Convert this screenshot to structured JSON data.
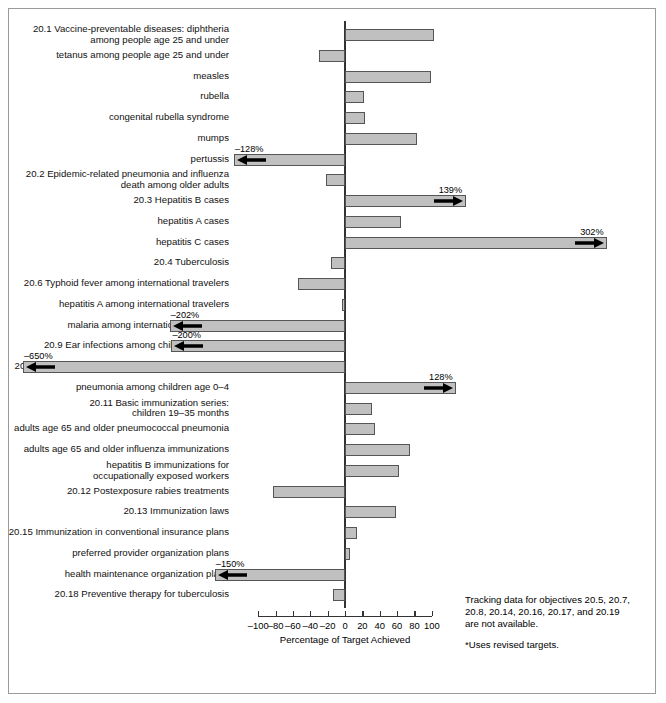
{
  "figure": {
    "xlabel": "Percentage of Target Achieved",
    "notes_line1": "Tracking data for objectives 20.5, 20.7,",
    "notes_line2": "20.8, 20.14, 20.16, 20.17, and 20.19",
    "notes_line3": "are not available.",
    "notes_line4": "*Uses revised targets.",
    "bar_fill": "#c0c0c0",
    "bar_stroke": "#555555",
    "axis_color": "#333333"
  },
  "chart_data": {
    "type": "bar",
    "orientation": "horizontal",
    "title": "",
    "xlabel": "Percentage of Target Achieved",
    "ylabel": "",
    "xlim": [
      -100,
      100
    ],
    "xticks": [
      -100,
      -80,
      -60,
      -40,
      -20,
      0,
      20,
      40,
      60,
      80,
      100
    ],
    "xticklabels": [
      "–100",
      "–80",
      "–60",
      "–40",
      "–20",
      "0",
      "20",
      "40",
      "60",
      "80",
      "100"
    ],
    "grid": false,
    "legend": "none",
    "annotations": [
      "Tracking data for objectives 20.5, 20.7, 20.8, 20.14, 20.16, 20.17, and 20.19 are not available.",
      "*Uses revised targets."
    ],
    "categories": [
      "20.1 Vaccine-preventable diseases: diphtheria\namong people age 25 and under",
      "tetanus among people age 25 and under",
      "measles",
      "rubella",
      "congenital rubella syndrome",
      "mumps",
      "pertussis",
      "20.2 Epidemic-related pneumonia and influenza\ndeath among older adults",
      "20.3 Hepatitis B cases",
      "hepatitis A cases",
      "hepatitis C cases",
      "20.4 Tuberculosis",
      "20.6 Typhoid fever among international travelers",
      "hepatitis A among international travelers",
      "malaria among international travelers*",
      "20.9 Ear infections among children age 0–4",
      "20.10 Pneumonia among people age 65 and over*",
      "pneumonia among children age 0–4",
      "20.11 Basic immunization series:\nchildren 19–35 months",
      "adults age 65 and older pneumococcal pneumonia",
      "adults age 65 and older influenza immunizations",
      "hepatitis B immunizations for\noccupationally exposed workers",
      "20.12 Postexposure rabies treatments",
      "20.13 Immunization laws",
      "20.15 Immunization in conventional insurance plans",
      "preferred provider organization plans",
      "health maintenance organization plans",
      "20.18 Preventive therapy for tuberculosis"
    ],
    "values": [
      102,
      -30,
      99,
      22,
      23,
      83,
      -128,
      -22,
      139,
      64,
      302,
      -16,
      -54,
      -3,
      -202,
      -200,
      -650,
      128,
      31,
      34,
      75,
      62,
      -83,
      59,
      14,
      6,
      -150,
      -14
    ],
    "value_labels": [
      null,
      null,
      null,
      null,
      null,
      null,
      "–128%",
      null,
      "139%",
      null,
      "302%",
      null,
      null,
      null,
      "–202%",
      "–200%",
      "–650%",
      "128%",
      null,
      null,
      null,
      null,
      null,
      null,
      null,
      null,
      "–150%",
      null
    ],
    "clipped": [
      false,
      false,
      false,
      false,
      false,
      false,
      true,
      false,
      true,
      false,
      true,
      false,
      false,
      false,
      true,
      true,
      true,
      true,
      false,
      false,
      false,
      false,
      false,
      false,
      false,
      false,
      true,
      false
    ]
  }
}
